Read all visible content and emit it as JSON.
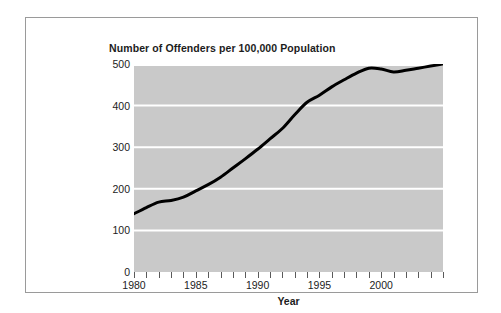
{
  "figure": {
    "title": "Number of Offenders per 100,000 Population",
    "background_color": "#ffffff",
    "frame_color": "#9a9a9a"
  },
  "chart_data": {
    "type": "line",
    "title": "Number of Offenders per 100,000 Population",
    "xlabel": "Year",
    "ylabel": "",
    "xlim": [
      1980,
      2005
    ],
    "ylim": [
      0,
      500
    ],
    "grid": true,
    "gridline_color": "#ffffff",
    "plot_background_color": "#c9c9c9",
    "line_color": "#000000",
    "legend": null,
    "ytick_labels": [
      "0",
      "100",
      "200",
      "300",
      "400",
      "500"
    ],
    "yticks": [
      0,
      100,
      200,
      300,
      400,
      500
    ],
    "gridlines": [
      100,
      200,
      300,
      400,
      500
    ],
    "xtick_labels": [
      "1980",
      "1985",
      "1990",
      "1995",
      "2000"
    ],
    "labeled_xticks": [
      1980,
      1985,
      1990,
      1995,
      2000
    ],
    "xticks": [
      1980,
      1981,
      1982,
      1983,
      1984,
      1985,
      1986,
      1987,
      1988,
      1989,
      1990,
      1991,
      1992,
      1993,
      1994,
      1995,
      1996,
      1997,
      1998,
      1999,
      2000,
      2001,
      2002,
      2003,
      2004,
      2005
    ],
    "x": [
      1980,
      1981,
      1982,
      1983,
      1984,
      1985,
      1986,
      1987,
      1988,
      1989,
      1990,
      1991,
      1992,
      1993,
      1994,
      1995,
      1996,
      1997,
      1998,
      1999,
      2000,
      2001,
      2002,
      2003,
      2004,
      2005
    ],
    "values": [
      140,
      155,
      168,
      172,
      180,
      195,
      210,
      228,
      250,
      272,
      295,
      320,
      345,
      378,
      408,
      425,
      445,
      462,
      478,
      490,
      488,
      481,
      485,
      490,
      495,
      500
    ],
    "series": [
      {
        "name": "Offenders per 100,000 population",
        "values": [
          140,
          155,
          168,
          172,
          180,
          195,
          210,
          228,
          250,
          272,
          295,
          320,
          345,
          378,
          408,
          425,
          445,
          462,
          478,
          490,
          488,
          481,
          485,
          490,
          495,
          500
        ]
      }
    ]
  }
}
